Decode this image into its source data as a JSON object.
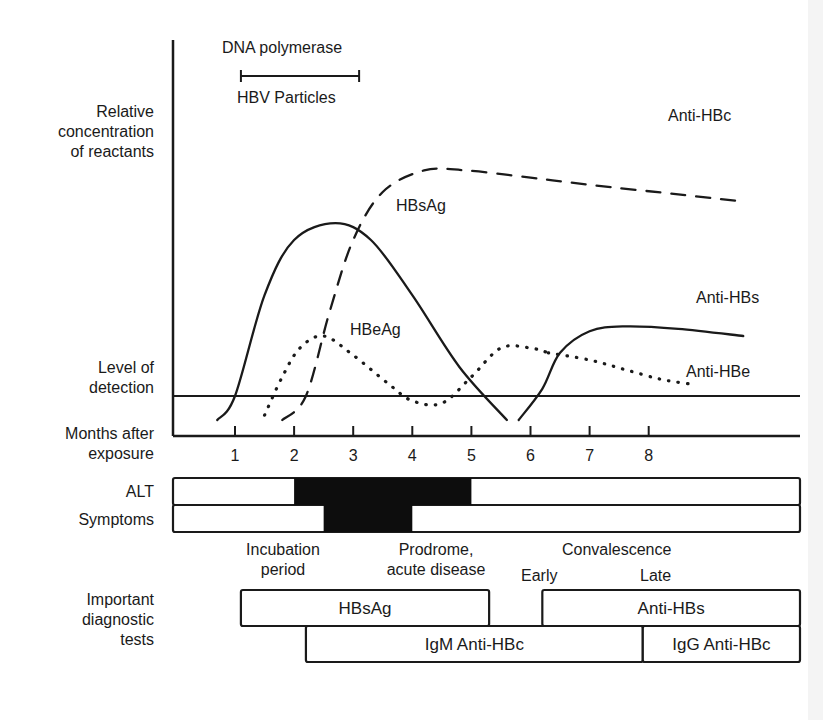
{
  "left_labels": {
    "y_axis": [
      "Relative",
      "concentration",
      "of reactants"
    ],
    "detection": [
      "Level of",
      "detection"
    ],
    "x_axis": [
      "Months after",
      "exposure"
    ],
    "alt": "ALT",
    "symptoms": "Symptoms",
    "tests": [
      "Important",
      "diagnostic",
      "tests"
    ]
  },
  "top_labels": {
    "dna_polymerase": "DNA polymerase",
    "hbv_particles": "HBV Particles"
  },
  "phases": {
    "incubation": [
      "Incubation",
      "period"
    ],
    "prodrome": [
      "Prodrome,",
      "acute disease"
    ],
    "convalescence": "Convalescence",
    "early": "Early",
    "late": "Late"
  },
  "chart_data": {
    "type": "line",
    "xlabel": "Months after exposure",
    "ylabel": "Relative concentration of reactants",
    "x_ticks": [
      1,
      2,
      3,
      4,
      5,
      6,
      7,
      8
    ],
    "xlim": [
      0,
      9.6
    ],
    "ylim": [
      0,
      100
    ],
    "detection_level": 10,
    "annotations": {
      "detection_line_label": "Level of detection",
      "bracket": {
        "label_top": "DNA polymerase",
        "label_bottom": "HBV Particles",
        "x_start": 1.1,
        "x_end": 3.1
      }
    },
    "series": [
      {
        "name": "HBsAg",
        "style": "solid",
        "points": [
          [
            0.7,
            0
          ],
          [
            1.0,
            10
          ],
          [
            1.5,
            52
          ],
          [
            2.0,
            75
          ],
          [
            2.7,
            82
          ],
          [
            3.3,
            75
          ],
          [
            4.0,
            52
          ],
          [
            4.8,
            22
          ],
          [
            5.6,
            0
          ]
        ]
      },
      {
        "name": "HBeAg",
        "style": "dotted",
        "points": [
          [
            1.5,
            2
          ],
          [
            1.8,
            18
          ],
          [
            2.1,
            30
          ],
          [
            2.5,
            35
          ],
          [
            3.0,
            27
          ],
          [
            3.6,
            15
          ],
          [
            4.0,
            8
          ],
          [
            4.5,
            7
          ],
          [
            5.0,
            18
          ],
          [
            5.5,
            30
          ],
          [
            6.0,
            30
          ],
          [
            6.3,
            28
          ]
        ]
      },
      {
        "name": "Anti-HBc",
        "style": "dashed",
        "points": [
          [
            1.8,
            0
          ],
          [
            2.2,
            10
          ],
          [
            2.6,
            45
          ],
          [
            3.0,
            75
          ],
          [
            3.5,
            95
          ],
          [
            4.2,
            104
          ],
          [
            4.9,
            104
          ],
          [
            6.0,
            101
          ],
          [
            7.0,
            98
          ],
          [
            8.5,
            94
          ],
          [
            9.6,
            91
          ]
        ]
      },
      {
        "name": "Anti-HBs",
        "style": "solid",
        "points": [
          [
            5.8,
            0
          ],
          [
            6.2,
            13
          ],
          [
            6.5,
            28
          ],
          [
            7.0,
            37
          ],
          [
            7.6,
            39
          ],
          [
            8.5,
            38
          ],
          [
            9.6,
            35
          ]
        ]
      },
      {
        "name": "Anti-HBe",
        "style": "dotted",
        "points": [
          [
            6.3,
            28
          ],
          [
            7.0,
            25
          ],
          [
            7.6,
            21
          ],
          [
            8.2,
            17
          ],
          [
            8.7,
            15
          ]
        ]
      }
    ],
    "series_labels": [
      "HBsAg",
      "HBeAg",
      "Anti-HBc",
      "Anti-HBs",
      "Anti-HBe"
    ],
    "bars": [
      {
        "name": "ALT",
        "elevated_from": 2.0,
        "elevated_to": 5.0
      },
      {
        "name": "Symptoms",
        "elevated_from": 2.5,
        "elevated_to": 4.0
      }
    ],
    "diagnostic_tests": [
      {
        "name": "HBsAg",
        "from": 1.1,
        "to": 5.3,
        "row": 0
      },
      {
        "name": "Anti-HBs",
        "from": 6.2,
        "to": 9.6,
        "row": 0
      },
      {
        "name": "IgM Anti-HBc",
        "from": 2.2,
        "to": 7.9,
        "row": 1
      },
      {
        "name": "IgG Anti-HBc",
        "from": 7.9,
        "to": 9.6,
        "row": 1
      }
    ]
  }
}
